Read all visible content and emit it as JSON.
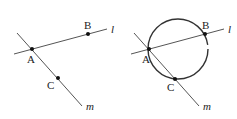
{
  "figures": [
    {
      "id": "left",
      "points": [
        {
          "label": "A",
          "x": 32,
          "y": 49,
          "lx": 27,
          "ly": 63
        },
        {
          "label": "B",
          "x": 88,
          "y": 34,
          "lx": 84,
          "ly": 29
        },
        {
          "label": "C",
          "x": 58,
          "y": 78,
          "lx": 47,
          "ly": 89
        }
      ],
      "lines": [
        {
          "name": "l",
          "x1": 14,
          "y1": 54,
          "x2": 107,
          "y2": 29,
          "lx": 111,
          "ly": 33
        },
        {
          "name": "m",
          "x1": 17,
          "y1": 33,
          "x2": 82,
          "y2": 106,
          "lx": 87,
          "ly": 109
        }
      ]
    },
    {
      "id": "right",
      "points": [
        {
          "label": "A",
          "x": 149,
          "y": 49,
          "lx": 142,
          "ly": 63
        },
        {
          "label": "B",
          "x": 205,
          "y": 34,
          "lx": 202,
          "ly": 29
        },
        {
          "label": "C",
          "x": 175,
          "y": 79,
          "lx": 167,
          "ly": 91
        }
      ],
      "lines": [
        {
          "name": "l",
          "x1": 131,
          "y1": 54,
          "x2": 224,
          "y2": 29,
          "lx": 228,
          "ly": 33
        },
        {
          "name": "m",
          "x1": 134,
          "y1": 33,
          "x2": 199,
          "y2": 106,
          "lx": 204,
          "ly": 109
        }
      ],
      "circle": {
        "cx": 178,
        "cy": 48,
        "r": 31
      }
    }
  ]
}
